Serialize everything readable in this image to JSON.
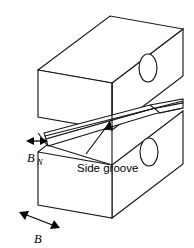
{
  "figure": {
    "kind": "isometric-line-drawing",
    "background_color": "#ffffff",
    "line_color": "#1a1a1a"
  },
  "labels": {
    "net_thickness": {
      "symbol": "B",
      "subscript": "N",
      "name": "net-thickness-dimension"
    },
    "gross_thickness": {
      "symbol": "B",
      "subscript": "",
      "name": "gross-thickness-dimension"
    },
    "callout": {
      "text": "Side groove",
      "name": "side-groove-callout"
    }
  },
  "parts": {
    "upper_block": "upper-half-block",
    "lower_block": "lower-half-block",
    "groove": "side-groove-channel",
    "upper_hole": "upper-loading-hole",
    "lower_hole": "lower-loading-hole"
  },
  "geometry": {
    "upper_top_face": "38,70 110,16 183,29 112,83",
    "upper_front_face": "38,70 112,83 112,130 38,117",
    "upper_right_face": "112,83 183,29 183,76 112,130",
    "lower_front_face": "38,152 112,165 112,218 38,205",
    "lower_right_face": "112,165 183,111 183,164 112,218",
    "groove_upper_band": "44,133 150,105 183,99 183,104 152,110 46,140",
    "groove_lower_band": "46,140 152,110 183,104 183,110 154,115 48,147",
    "upper_hole_center": [
      148,
      68
    ],
    "upper_hole_radii": [
      9,
      14
    ],
    "lower_hole_center": [
      149,
      152
    ],
    "lower_hole_radii": [
      9,
      14
    ]
  },
  "dimensions": {
    "bn_arrow": {
      "x1": 27,
      "y1": 147,
      "x2": 47,
      "y2": 147
    },
    "bn_label_pos": {
      "x": 30,
      "y": 165
    },
    "b_arrow": {
      "x1": 20,
      "y1": 215,
      "x2": 57,
      "y2": 230
    },
    "b_label_pos": {
      "x": 34,
      "y": 243
    },
    "callout_leader": {
      "x1": 85,
      "y1": 153,
      "x2": 106,
      "y2": 124
    },
    "callout_text_pos": {
      "x": 77,
      "y": 170
    }
  }
}
